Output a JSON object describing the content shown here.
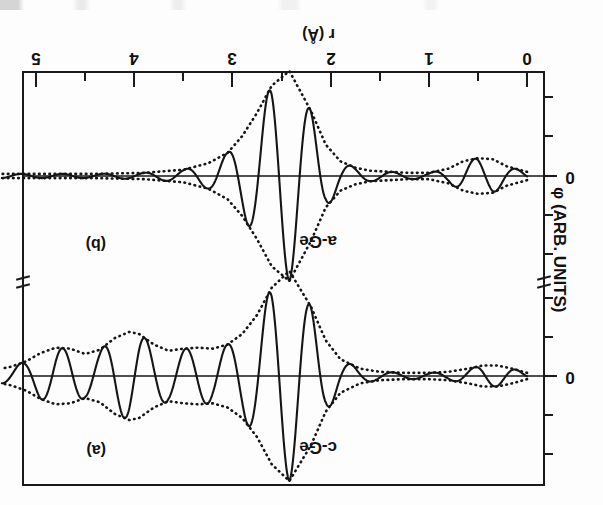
{
  "figure": {
    "kind": "scientific-figure-scan",
    "orientation": "rotated-180",
    "x_axis": {
      "label": "r (Å)",
      "ticks": [
        "0",
        "1",
        "2",
        "3",
        "4",
        "5"
      ],
      "min": 0,
      "max": 5.35,
      "minor_step": 0.5
    },
    "y_axis": {
      "label": "φ (ARB. UNITS)",
      "zero_label": "0"
    },
    "panels": [
      {
        "tag": "(b)",
        "sample": "a-Ge"
      },
      {
        "tag": "(a)",
        "sample": "c-Ge"
      }
    ]
  },
  "chart_data": {
    "type": "line",
    "title": "",
    "xlabel": "r (Å)",
    "ylabel": "φ (ARB. UNITS)",
    "xlim": [
      0,
      5.35
    ],
    "grid": false,
    "legend": "none",
    "panels": [
      {
        "tag": "(b)",
        "name": "a-Ge",
        "description": "Amorphous germanium: single dominant first-shell oscillation near r = 2.4 A, small low-r feature near r = 0.5 A, essentially flat beyond r = 3.2 A (no long-range order).",
        "zero_label": "0",
        "features": [
          {
            "r": 0.5,
            "kind": "minor-oscillation",
            "envelope_amplitude": 0.17
          },
          {
            "r": 2.42,
            "kind": "main-shell-oscillation",
            "envelope_amplitude": 1.0
          },
          {
            "r": 3.4,
            "kind": "flat-tail",
            "envelope_amplitude": 0.03
          }
        ],
        "envelope": {
          "r": [
            0.0,
            0.2,
            0.35,
            0.5,
            0.65,
            0.8,
            1.0,
            1.2,
            1.4,
            1.6,
            1.75,
            1.9,
            2.05,
            2.2,
            2.42,
            2.6,
            2.75,
            2.9,
            3.05,
            3.25,
            3.5,
            3.9,
            4.4,
            5.0,
            5.35
          ],
          "amp": [
            0.04,
            0.09,
            0.16,
            0.17,
            0.14,
            0.07,
            0.03,
            0.03,
            0.04,
            0.05,
            0.08,
            0.14,
            0.3,
            0.62,
            1.0,
            0.86,
            0.6,
            0.38,
            0.22,
            0.12,
            0.06,
            0.03,
            0.02,
            0.02,
            0.02
          ]
        },
        "oscillation": {
          "wavelength": 0.42,
          "phase_deg": 0,
          "r_range": [
            0.0,
            5.35
          ]
        }
      },
      {
        "tag": "(a)",
        "name": "c-Ge",
        "description": "Crystalline germanium: strong first shell near r = 2.4 A plus well-resolved higher coordination shells near r = 3.3, 4.0 and 4.6 A extending to r = 5 A (long-range order).",
        "zero_label": "0",
        "features": [
          {
            "r": 0.45,
            "kind": "minor-oscillation",
            "envelope_amplitude": 0.1
          },
          {
            "r": 2.42,
            "kind": "first-shell",
            "envelope_amplitude": 1.0
          },
          {
            "r": 3.35,
            "kind": "second-shell",
            "envelope_amplitude": 0.27
          },
          {
            "r": 4.05,
            "kind": "third-shell",
            "envelope_amplitude": 0.42
          },
          {
            "r": 4.7,
            "kind": "fourth-shell",
            "envelope_amplitude": 0.27
          }
        ],
        "envelope": {
          "r": [
            0.0,
            0.15,
            0.3,
            0.45,
            0.6,
            0.8,
            1.0,
            1.25,
            1.5,
            1.7,
            1.9,
            2.05,
            2.2,
            2.42,
            2.6,
            2.75,
            2.9,
            3.05,
            3.2,
            3.35,
            3.5,
            3.65,
            3.8,
            3.95,
            4.05,
            4.2,
            4.35,
            4.5,
            4.65,
            4.8,
            4.95,
            5.1,
            5.25,
            5.35
          ],
          "amp": [
            0.03,
            0.07,
            0.1,
            0.1,
            0.07,
            0.04,
            0.03,
            0.03,
            0.04,
            0.07,
            0.16,
            0.34,
            0.66,
            1.0,
            0.84,
            0.58,
            0.4,
            0.3,
            0.26,
            0.27,
            0.26,
            0.24,
            0.3,
            0.4,
            0.42,
            0.36,
            0.25,
            0.21,
            0.26,
            0.27,
            0.22,
            0.14,
            0.09,
            0.07
          ]
        },
        "oscillation": {
          "wavelength": 0.42,
          "phase_deg": 0,
          "r_range": [
            0.0,
            5.35
          ]
        }
      }
    ]
  }
}
